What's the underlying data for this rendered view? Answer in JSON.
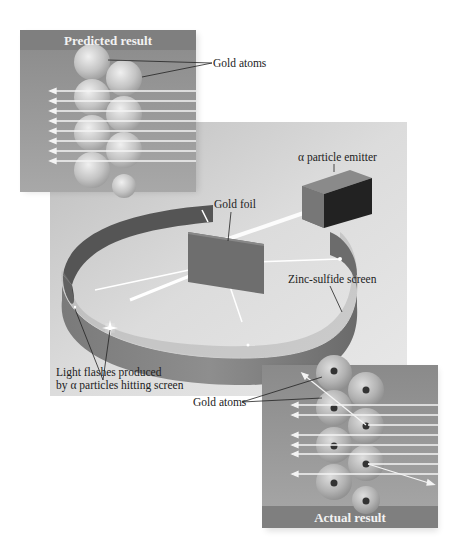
{
  "figure": {
    "predicted_panel": {
      "title": "Predicted result",
      "label_gold_atoms": "Gold atoms"
    },
    "apparatus": {
      "label_emitter": "α particle emitter",
      "label_foil": "Gold foil",
      "label_screen": "Zinc-sulfide screen",
      "label_flashes_line1": "Light flashes produced",
      "label_flashes_line2": "by α particles hitting screen"
    },
    "actual_panel": {
      "title": "Actual result",
      "label_gold_atoms": "Gold atoms"
    }
  }
}
